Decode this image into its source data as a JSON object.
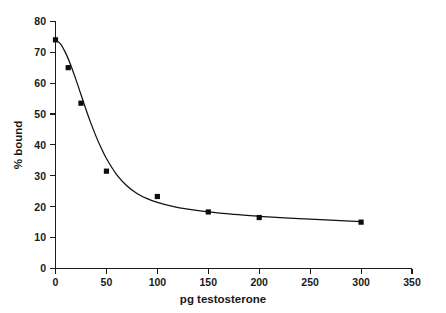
{
  "chart_data": {
    "type": "line",
    "title": "",
    "subtitle": "",
    "xlabel": "pg testosterone",
    "ylabel": "% bound",
    "xlim": [
      0,
      350
    ],
    "ylim": [
      0,
      80
    ],
    "xticks": [
      0,
      50,
      100,
      150,
      200,
      250,
      300,
      350
    ],
    "xtick_labels": [
      "0",
      "50",
      "100",
      "150",
      "200",
      "250",
      "300",
      "350"
    ],
    "yticks": [
      0,
      10,
      20,
      30,
      40,
      50,
      60,
      70,
      80
    ],
    "ytick_labels": [
      "0",
      "10",
      "20",
      "30",
      "40",
      "50",
      "60",
      "70",
      "80"
    ],
    "grid": false,
    "legend": false,
    "legend_position": "none",
    "marker": "filled-square",
    "marker_color": "#0d0d0d",
    "line_color": "#111111",
    "background_color": "#ffffff",
    "axis_color": "#1a1a1a",
    "tick_direction": "out",
    "series": [
      {
        "name": "% bound",
        "x": [
          0,
          12.5,
          25,
          50,
          100,
          150,
          200,
          300
        ],
        "values": [
          74,
          65,
          53.5,
          31.5,
          23.3,
          18.3,
          16.5,
          15
        ]
      }
    ],
    "fitted_curve": {
      "name": "fitted binding curve",
      "x": [
        0,
        5,
        10,
        15,
        20,
        25,
        30,
        35,
        40,
        45,
        50,
        60,
        70,
        80,
        90,
        100,
        115,
        130,
        150,
        175,
        200,
        225,
        250,
        275,
        300
      ],
      "y": [
        74.0,
        72.6,
        69.7,
        65.8,
        61.2,
        56.3,
        51.4,
        46.8,
        42.6,
        38.9,
        35.6,
        30.4,
        26.8,
        24.3,
        22.6,
        21.4,
        20.1,
        19.2,
        18.3,
        17.5,
        16.9,
        16.4,
        16.0,
        15.6,
        15.2
      ]
    },
    "annotations": []
  }
}
